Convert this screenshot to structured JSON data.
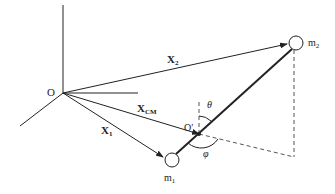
{
  "diagram": {
    "labels": {
      "origin": "O",
      "origin_prime": "O′",
      "x2_main": "X",
      "x2_sub": "2",
      "xcm_main": "X",
      "xcm_sub": "CM",
      "x1_main": "X",
      "x1_sub": "1",
      "m2_main": "m",
      "m2_sub": "2",
      "m1_main": "m",
      "m1_sub": "1",
      "theta": "θ",
      "phi": "φ"
    },
    "colors": {
      "line": "#222222",
      "dashed": "#555555",
      "background": "#ffffff"
    }
  }
}
